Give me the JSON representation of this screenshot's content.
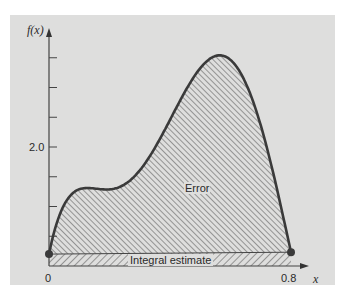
{
  "chart_data": {
    "type": "area",
    "title": "",
    "xlabel": "x",
    "ylabel": "f(x)",
    "x_ticks": [
      {
        "value": 0,
        "label": "0"
      },
      {
        "value": 0.8,
        "label": "0.8"
      }
    ],
    "y_ticks": [
      0.5,
      1.0,
      1.5,
      2.0,
      2.5,
      3.0,
      3.5
    ],
    "y_tick_labels": [
      {
        "value": 2.0,
        "label": "2.0"
      }
    ],
    "xlim": [
      0,
      0.8
    ],
    "ylim": [
      0,
      3.7
    ],
    "function": "f(x) = 0.2 + 25x - 200x^2 + 675x^3 - 900x^4 + 400x^5",
    "series": [
      {
        "name": "f(x)",
        "x": [
          0,
          0.1,
          0.2,
          0.3,
          0.4,
          0.5,
          0.6,
          0.7,
          0.8
        ],
        "values": [
          0.2,
          1.289,
          1.288,
          1.607,
          2.456,
          3.325,
          3.464,
          2.363,
          0.232
        ]
      },
      {
        "name": "Integral estimate",
        "x": [
          0,
          0.8
        ],
        "values": [
          0.2,
          0.232
        ]
      }
    ],
    "annotations": [
      {
        "text": "Error",
        "region": "area between f(x) and trapezoid"
      },
      {
        "text": "Integral estimate",
        "region": "trapezoid under straight line"
      }
    ],
    "grid": false,
    "legend": "none"
  },
  "labels": {
    "y_axis": "f(x)",
    "x_axis": "x",
    "y_tick_2": "2.0",
    "x_zero": "0",
    "x_end": "0.8",
    "error": "Error",
    "integral": "Integral estimate"
  },
  "colors": {
    "panel": "#dededd",
    "curve": "#3a3a3a",
    "hatch": "#5a5a5a"
  }
}
